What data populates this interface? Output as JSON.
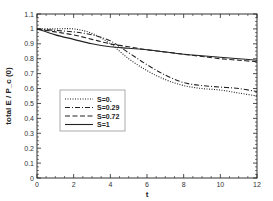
{
  "chart_data": {
    "type": "line",
    "title": "",
    "xlabel": "t",
    "ylabel": "total E / P_c (0)",
    "xlim": [
      0,
      12
    ],
    "ylim": [
      0,
      1.1
    ],
    "x_ticks": [
      "0",
      "2",
      "4",
      "6",
      "8",
      "10",
      "12"
    ],
    "y_ticks": [
      "0",
      "0.1",
      "0.2",
      "0.3",
      "0.4",
      "0.5",
      "0.6",
      "0.7",
      "0.8",
      "0.9",
      "1",
      "1.1"
    ],
    "grid": false,
    "legend_position": "inside-left-middle",
    "x": [
      0,
      1,
      2,
      3,
      4,
      5,
      6,
      7,
      8,
      9,
      10,
      11,
      12
    ],
    "series": [
      {
        "name": "S=0.",
        "style": "dotted",
        "values": [
          1.0,
          1.0,
          1.0,
          0.97,
          0.9,
          0.8,
          0.72,
          0.66,
          0.62,
          0.6,
          0.59,
          0.57,
          0.55
        ]
      },
      {
        "name": "S=0.29",
        "style": "dashdot",
        "values": [
          1.0,
          0.99,
          0.98,
          0.96,
          0.92,
          0.84,
          0.76,
          0.69,
          0.64,
          0.62,
          0.61,
          0.6,
          0.58
        ]
      },
      {
        "name": "S=0.72",
        "style": "dashed",
        "values": [
          1.0,
          0.98,
          0.96,
          0.93,
          0.9,
          0.88,
          0.86,
          0.845,
          0.83,
          0.815,
          0.8,
          0.79,
          0.78
        ]
      },
      {
        "name": "S=1",
        "style": "solid",
        "values": [
          1.0,
          0.96,
          0.93,
          0.9,
          0.88,
          0.87,
          0.86,
          0.845,
          0.83,
          0.82,
          0.81,
          0.8,
          0.79
        ]
      }
    ]
  },
  "colors": {
    "line": "#222222",
    "axis": "#333333",
    "background": "#ffffff"
  }
}
